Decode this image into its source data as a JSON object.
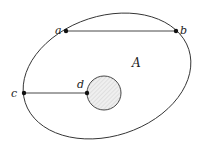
{
  "diagram": {
    "region_label": "A",
    "points": [
      {
        "id": "a",
        "label": "a"
      },
      {
        "id": "b",
        "label": "b"
      },
      {
        "id": "c",
        "label": "c"
      },
      {
        "id": "d",
        "label": "d"
      }
    ],
    "segments": [
      {
        "from": "a",
        "to": "b"
      },
      {
        "from": "c",
        "to": "d"
      }
    ],
    "inner_disk": {
      "description": "hatched hole"
    },
    "colors": {
      "stroke": "#333333",
      "hole_fill": "#eeeeee",
      "hatch": "#c8c8c8"
    }
  }
}
